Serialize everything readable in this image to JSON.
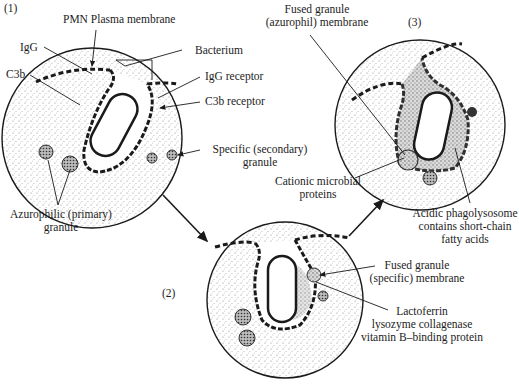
{
  "steps": {
    "one": "(1)",
    "two": "(2)",
    "three": "(3)"
  },
  "panel1": {
    "pmn_membrane": "PMN Plasma membrane",
    "igg": "IgG",
    "c3b": "C3b",
    "bacterium": "Bacterium",
    "igg_receptor": "IgG receptor",
    "c3b_receptor": "C3b receptor",
    "specific_granule": "Specific (secondary)",
    "specific_granule_2": "granule",
    "azurophilic_granule": "Azurophilic (primary)",
    "azurophilic_granule_2": "granule"
  },
  "panel2": {
    "fused_specific": "Fused granule",
    "fused_specific_2": "(specific) membrane",
    "contents_1": "Lactoferrin",
    "contents_2": "lysozyme collagenase",
    "contents_3": "vitamin B–binding protein"
  },
  "panel3": {
    "fused_azurophil": "Fused granule",
    "fused_azurophil_2": "(azurophil) membrane",
    "cationic_1": "Cationic microbial",
    "cationic_2": "proteins",
    "acidic_1": "Acidic phagolysosome",
    "acidic_2": "contains short-chain",
    "acidic_3": "fatty acids"
  },
  "colors": {
    "ink": "#1a1a1a",
    "stipple": "#9a9a9a",
    "background": "#ffffff"
  }
}
